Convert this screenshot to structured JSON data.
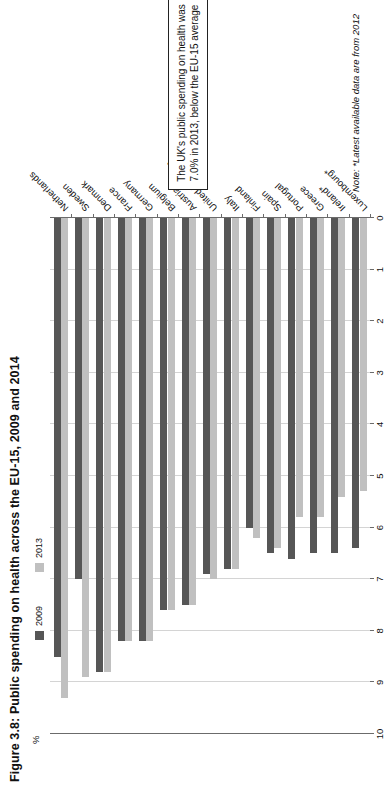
{
  "figure": {
    "title": "Figure 3.8: Public spending on health across the EU-15, 2009 and 2014",
    "axis_unit": "%",
    "note": "Note: *Latest available data are from 2012",
    "callout": "The UK's public spending on health was 7.0% in 2013, below the EU-15 average"
  },
  "legend": {
    "items": [
      {
        "label": "2009",
        "color": "#565656"
      },
      {
        "label": "2013",
        "color": "#c0c0c0"
      }
    ]
  },
  "chart_data": {
    "type": "bar",
    "orientation": "horizontal",
    "title": "Figure 3.8: Public spending on health across the EU-15, 2009 and 2014",
    "xlabel": "%",
    "ylabel": "",
    "xlim": [
      0,
      10
    ],
    "xticks": [
      "0",
      "1",
      "2",
      "3",
      "4",
      "5",
      "6",
      "7",
      "8",
      "9",
      "10"
    ],
    "grid": true,
    "legend_position": "top-left",
    "categories": [
      "Netherlands",
      "Sweden",
      "Denmark",
      "France",
      "Germany",
      "Belgium",
      "Austria",
      "United Kingdom",
      "Italy",
      "Finland",
      "Spain",
      "Portugal",
      "Greece",
      "Ireland*",
      "Luxembourg*"
    ],
    "series": [
      {
        "name": "2009",
        "color": "#565656",
        "values": [
          8.5,
          7.0,
          8.8,
          8.2,
          8.2,
          7.6,
          7.5,
          6.9,
          6.8,
          6.0,
          6.5,
          6.6,
          6.5,
          6.5,
          6.4
        ]
      },
      {
        "name": "2013",
        "color": "#c0c0c0",
        "values": [
          9.3,
          8.9,
          8.8,
          8.2,
          8.2,
          7.6,
          7.5,
          7.0,
          6.8,
          6.2,
          6.4,
          5.8,
          5.8,
          5.4,
          5.3
        ]
      }
    ]
  }
}
